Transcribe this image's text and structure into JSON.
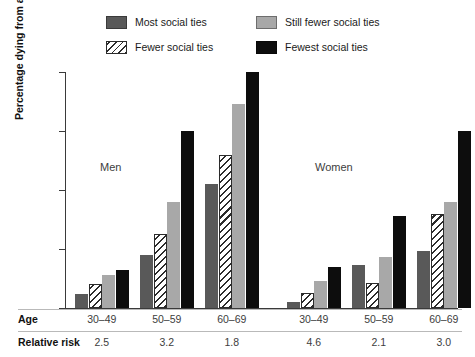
{
  "legend": {
    "entries": [
      {
        "label": "Most social ties",
        "style": "solid",
        "color": "#595959"
      },
      {
        "label": "Fewer social ties",
        "style": "hatch",
        "color": "#ffffff"
      },
      {
        "label": "Still fewer social ties",
        "style": "solid",
        "color": "#a8a8a8"
      },
      {
        "label": "Fewest social ties",
        "style": "solid",
        "color": "#0d0d0d"
      }
    ]
  },
  "axes": {
    "y_title": "Percentage dying from all causes",
    "y_ticks": [
      "0",
      "10",
      "20",
      "30",
      "40"
    ]
  },
  "panels": {
    "men": "Men",
    "women": "Women"
  },
  "table": {
    "age_header": "Age",
    "risk_header": "Relative risk",
    "age_values": [
      "30–49",
      "50–59",
      "60–69",
      "30–49",
      "50–59",
      "60–69"
    ],
    "risk_values": [
      "2.5",
      "3.2",
      "1.8",
      "4.6",
      "2.1",
      "3.0"
    ]
  },
  "chart_data": {
    "type": "bar",
    "title": "",
    "xlabel": "Age",
    "ylabel": "Percentage dying from all causes",
    "ylim": [
      0,
      40
    ],
    "yticks": [
      0,
      10,
      20,
      30,
      40
    ],
    "grid": false,
    "legend_position": "top",
    "categories": [
      "30–49",
      "50–59",
      "60–69",
      "30–49",
      "50–59",
      "60–69"
    ],
    "panels": [
      "Men",
      "Men",
      "Men",
      "Women",
      "Women",
      "Women"
    ],
    "relative_risk": [
      2.5,
      3.2,
      1.8,
      4.6,
      2.1,
      3.0
    ],
    "series": [
      {
        "name": "Most social ties",
        "color": "#595959",
        "values": [
          2.3,
          9.0,
          21.0,
          1.0,
          7.3,
          9.6
        ]
      },
      {
        "name": "Fewer social ties",
        "color": "#ffffff",
        "values": [
          4.0,
          12.5,
          26.0,
          2.5,
          4.3,
          16.0
        ]
      },
      {
        "name": "Still fewer social ties",
        "color": "#a8a8a8",
        "values": [
          5.6,
          18.0,
          34.5,
          4.5,
          8.6,
          18.0
        ]
      },
      {
        "name": "Fewest social ties",
        "color": "#0d0d0d",
        "values": [
          6.5,
          30.0,
          40.0,
          7.0,
          15.6,
          30.0
        ]
      }
    ]
  }
}
